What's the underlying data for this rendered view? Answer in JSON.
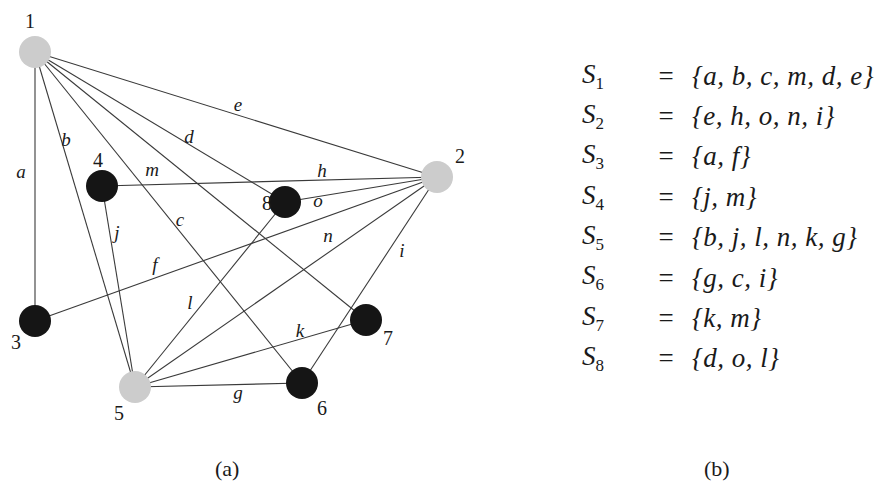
{
  "graph": {
    "nodes": [
      {
        "id": "1",
        "x": 35,
        "y": 52,
        "color": "gray",
        "label_x": 25,
        "label_y": 28
      },
      {
        "id": "2",
        "x": 437,
        "y": 177,
        "color": "gray",
        "label_x": 455,
        "label_y": 163
      },
      {
        "id": "3",
        "x": 35,
        "y": 321,
        "color": "black",
        "label_x": 11,
        "label_y": 349
      },
      {
        "id": "4",
        "x": 102,
        "y": 186,
        "color": "black",
        "label_x": 93,
        "label_y": 167
      },
      {
        "id": "5",
        "x": 135,
        "y": 387,
        "color": "gray",
        "label_x": 114,
        "label_y": 420
      },
      {
        "id": "6",
        "x": 302,
        "y": 383,
        "color": "black",
        "label_x": 317,
        "label_y": 415
      },
      {
        "id": "7",
        "x": 366,
        "y": 320,
        "color": "black",
        "label_x": 383,
        "label_y": 345
      },
      {
        "id": "8",
        "x": 285,
        "y": 202,
        "color": "black",
        "label_x": 262,
        "label_y": 210
      }
    ],
    "edges": [
      {
        "label": "a",
        "from": "1",
        "to": "3",
        "lx": 21,
        "ly": 178
      },
      {
        "label": "b",
        "from": "1",
        "to": "5",
        "lx": 66,
        "ly": 146
      },
      {
        "label": "c",
        "from": "1",
        "to": "6",
        "lx": 180,
        "ly": 226
      },
      {
        "label": "m",
        "from": "1",
        "to": "7",
        "lx": 152,
        "ly": 176
      },
      {
        "label": "d",
        "from": "1",
        "to": "8",
        "lx": 189,
        "ly": 143
      },
      {
        "label": "e",
        "from": "1",
        "to": "2",
        "lx": 238,
        "ly": 111
      },
      {
        "label": "h",
        "from": "4",
        "to": "2",
        "lx": 322,
        "ly": 177
      },
      {
        "label": "o",
        "from": "8",
        "to": "2",
        "lx": 318,
        "ly": 207
      },
      {
        "label": "f",
        "from": "3",
        "to": "2",
        "lx": 155,
        "ly": 271
      },
      {
        "label": "n",
        "from": "5",
        "to": "2",
        "lx": 328,
        "ly": 242
      },
      {
        "label": "i",
        "from": "6",
        "to": "2",
        "lx": 402,
        "ly": 257
      },
      {
        "label": "j",
        "from": "5",
        "to": "4",
        "lx": 117,
        "ly": 239
      },
      {
        "label": "l",
        "from": "5",
        "to": "8",
        "lx": 190,
        "ly": 309
      },
      {
        "label": "k",
        "from": "5",
        "to": "7",
        "lx": 300,
        "ly": 337
      },
      {
        "label": "g",
        "from": "5",
        "to": "6",
        "lx": 238,
        "ly": 399
      }
    ]
  },
  "captions": {
    "a": "(a)",
    "b": "(b)"
  },
  "sets": [
    {
      "name": "S",
      "sub": "1",
      "eq": "=",
      "value": "{a, b, c, m, d, e}"
    },
    {
      "name": "S",
      "sub": "2",
      "eq": "=",
      "value": "{e, h, o, n, i}"
    },
    {
      "name": "S",
      "sub": "3",
      "eq": "=",
      "value": "{a, f}"
    },
    {
      "name": "S",
      "sub": "4",
      "eq": "=",
      "value": "{j, m}"
    },
    {
      "name": "S",
      "sub": "5",
      "eq": "=",
      "value": "{b, j, l, n, k, g}"
    },
    {
      "name": "S",
      "sub": "6",
      "eq": "=",
      "value": "{g, c, i}"
    },
    {
      "name": "S",
      "sub": "7",
      "eq": "=",
      "value": "{k, m}"
    },
    {
      "name": "S",
      "sub": "8",
      "eq": "=",
      "value": "{d, o, l}"
    }
  ],
  "colors": {
    "gray_node": "#cccccc",
    "black_node": "#151515",
    "edge": "#3a3a3a"
  }
}
